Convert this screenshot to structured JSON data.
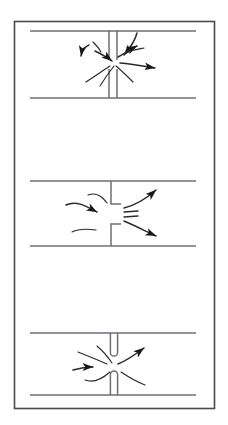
{
  "figure": {
    "title": "",
    "caption": "",
    "background_color": "#ffffff",
    "ink_color": "#2a2a2e",
    "border": {
      "name": "outer-frame",
      "x": 14.5,
      "y": 21.5,
      "width": 200,
      "height": 387,
      "stroke": "#4a4a52",
      "stroke_width": 1.6,
      "fill": "none"
    },
    "panels": [
      {
        "id": "panel-top",
        "label": "Flow through a thin straight gap restriction",
        "restriction_type": "straight-slot",
        "pipe": {
          "top_line": {
            "x1": 30,
            "y1": 31,
            "x2": 196,
            "y2": 31
          },
          "bottom_line": {
            "x1": 30,
            "y1": 98,
            "x2": 196,
            "y2": 98
          },
          "stroke": "#6e6e76",
          "stroke_width": 1.7
        },
        "plate": {
          "gap_center_x": 113,
          "gap_half_width": 4.0,
          "upper_stem_y1": 31,
          "upper_stem_y2": 60,
          "lower_stem_y1": 69,
          "lower_stem_y2": 98,
          "stroke": "#6e6e76",
          "stroke_width": 1.5
        },
        "flow_arrows": [
          {
            "name": "flow-arrow-in-upper-right",
            "path": "M 137,33 C 135,41 130,48 124,55",
            "head": true
          },
          {
            "name": "flow-arrow-in-upper-left",
            "path": "M 89,45 C 86,46 82,50 81,56",
            "head": true
          },
          {
            "name": "flow-arrow-in-left",
            "path": "M 95,51 C 101,54 107,57 112,61",
            "head": true
          },
          {
            "name": "flow-arrow-diag-right",
            "path": "M 118,57 C 125,53 131,49 137,46",
            "head": true
          },
          {
            "name": "flow-arrow-out-right",
            "path": "M 120,63 C 132,64 143,66 155,68",
            "head": true
          },
          {
            "name": "flow-streak-curl-left",
            "path": "M 93,42 C 96,45 99,48 101,52",
            "head": false
          },
          {
            "name": "flow-streak-lower-left",
            "path": "M 86,82 C 94,77 102,71 110,66",
            "head": false
          },
          {
            "name": "flow-streak-lower-mid",
            "path": "M 100,86 C 105,78 110,71 114,66",
            "head": false
          },
          {
            "name": "flow-streak-lower-right",
            "path": "M 133,82 C 127,76 121,70 116,66",
            "head": false
          },
          {
            "name": "flow-streak-upper-curl",
            "path": "M 128,52 C 133,50 139,49 144,48",
            "head": false
          }
        ]
      },
      {
        "id": "panel-middle",
        "label": "Flow through a square-edged orifice plate",
        "restriction_type": "orifice-plate",
        "pipe": {
          "top_line": {
            "x1": 30,
            "y1": 181,
            "x2": 196,
            "y2": 181
          },
          "bottom_line": {
            "x1": 30,
            "y1": 246,
            "x2": 196,
            "y2": 246
          },
          "stroke": "#6e6e76",
          "stroke_width": 1.7
        },
        "plate": {
          "stem_x": 111,
          "upper_stem_y1": 181,
          "upper_stem_y2": 204,
          "upper_flange_x2": 121,
          "lower_stem_y1": 224,
          "lower_stem_y2": 246,
          "lower_flange_x2": 121,
          "stroke": "#6e6e76",
          "stroke_width": 1.5
        },
        "vena_contracta_marks": [
          {
            "name": "vena-mark-upper",
            "path": "M 124,212 L 138,211"
          },
          {
            "name": "vena-mark-lower",
            "path": "M 124,217 L 138,216"
          }
        ],
        "flow_arrows": [
          {
            "name": "flow-arrow-in-top",
            "path": "M 88,195 C 95,192 102,196 107,203",
            "head": false
          },
          {
            "name": "flow-arrow-in-mid",
            "path": "M 66,205 C 76,200 86,206 97,212",
            "head": true
          },
          {
            "name": "flow-arrow-in-bottom",
            "path": "M 72,232 C 80,228 89,229 96,230",
            "head": false
          },
          {
            "name": "flow-arrow-out-upper",
            "path": "M 124,208 C 136,205 147,198 156,190",
            "head": true
          },
          {
            "name": "flow-arrow-out-lower",
            "path": "M 124,221 C 136,226 147,232 156,236",
            "head": true
          }
        ]
      },
      {
        "id": "panel-bottom",
        "label": "Flow through a rounded-edge slot restriction",
        "restriction_type": "rounded-slot",
        "pipe": {
          "top_line": {
            "x1": 30,
            "y1": 333,
            "x2": 196,
            "y2": 333
          },
          "bottom_line": {
            "x1": 30,
            "y1": 395,
            "x2": 196,
            "y2": 395
          },
          "stroke": "#6e6e76",
          "stroke_width": 1.7
        },
        "plate": {
          "gap_center_x": 114,
          "gap_half_width": 3.6,
          "upper_stem_y1": 333,
          "upper_stem_y2": 356,
          "upper_tip_rounded": true,
          "lower_stem_y1": 371,
          "lower_stem_y2": 395,
          "lower_tip_rounded": true,
          "stroke": "#6e6e76",
          "stroke_width": 1.5
        },
        "flow_arrows": [
          {
            "name": "flow-arrow-in-upper-left",
            "path": "M 78,352 C 88,356 98,360 107,364",
            "head": false
          },
          {
            "name": "flow-arrow-in-left",
            "path": "M 73,370 C 80,368 87,367 93,367",
            "head": true
          },
          {
            "name": "flow-arrow-out-upper",
            "path": "M 118,364 C 128,360 136,354 144,348",
            "head": true
          },
          {
            "name": "flow-streak-lower-curl",
            "path": "M 85,380 C 93,383 101,380 110,372",
            "head": false
          },
          {
            "name": "flow-streak-lower-right",
            "path": "M 121,372 C 130,378 137,382 145,385",
            "head": false
          },
          {
            "name": "flow-streak-upper-curl",
            "path": "M 97,346 C 103,351 108,357 112,363",
            "head": false
          }
        ]
      }
    ]
  }
}
